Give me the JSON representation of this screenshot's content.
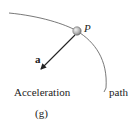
{
  "diagram": {
    "point_label": "P",
    "vector_label": "a",
    "caption": "Acceleration",
    "path_label": "path",
    "figure_label": "(g)",
    "colors": {
      "curve": "#555555",
      "arrow": "#222222",
      "particle_fill": "#bbbbbb",
      "text": "#222222"
    }
  }
}
